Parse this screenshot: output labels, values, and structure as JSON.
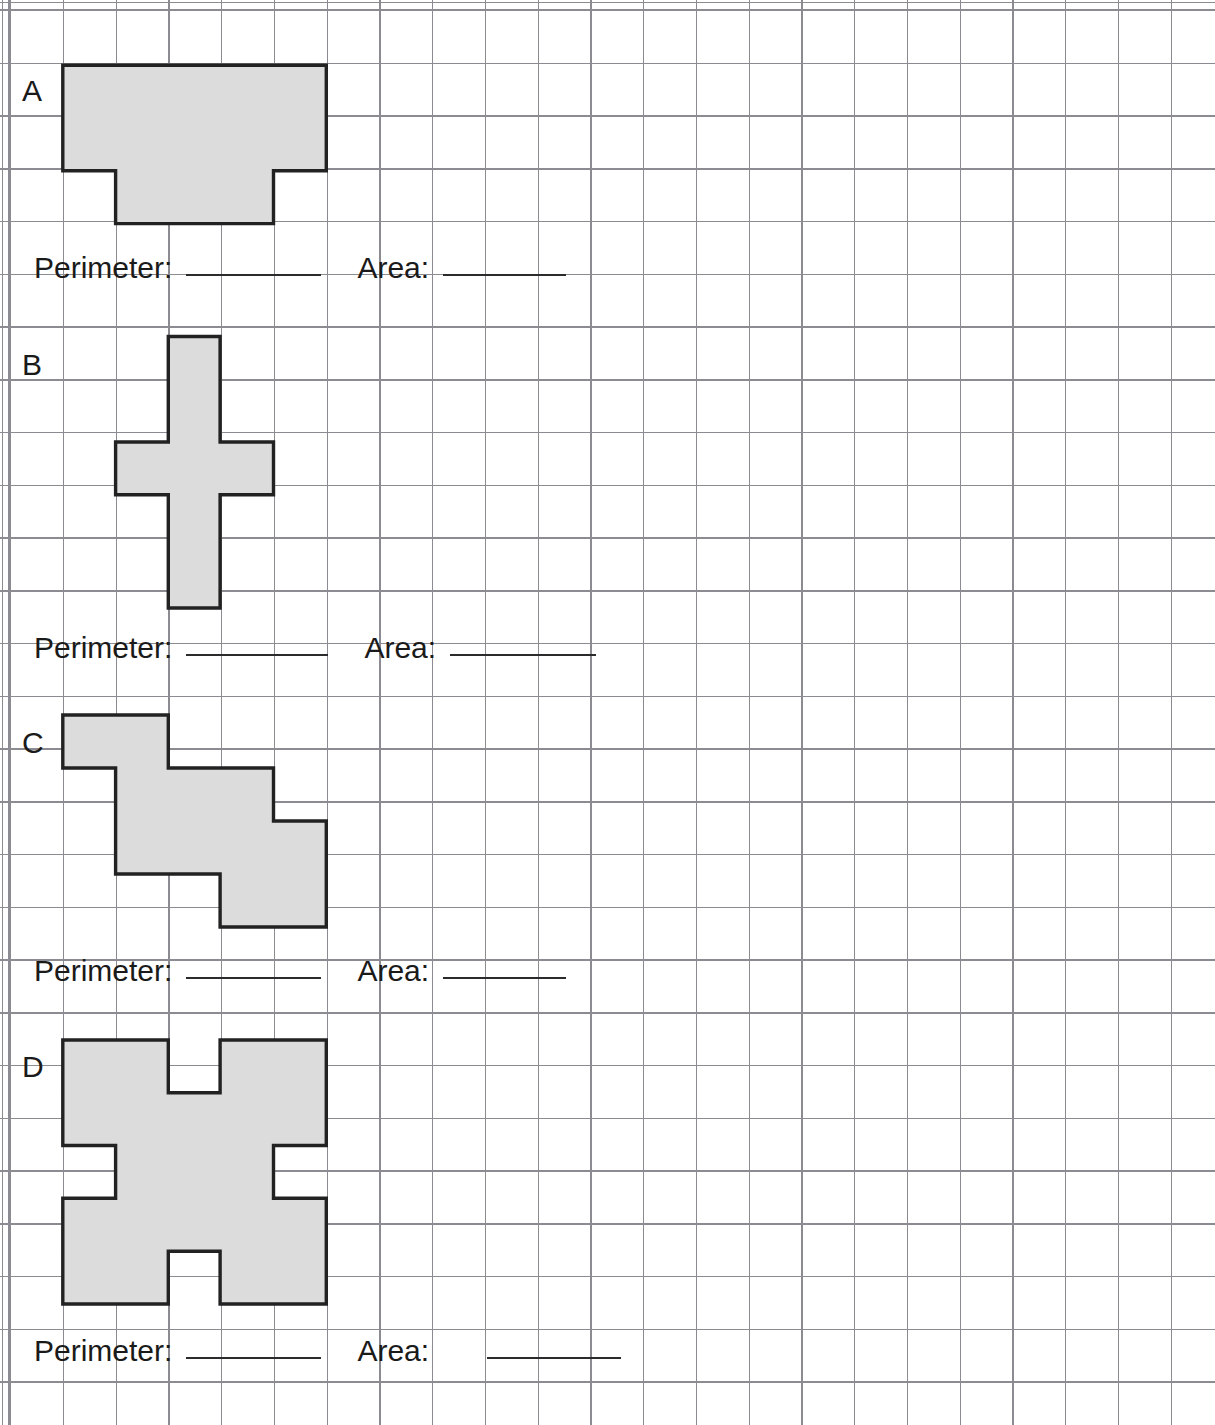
{
  "worksheet": {
    "title": "Perimeter and Area of Rectilinear Shapes Worksheet",
    "grid": {
      "cell_size_px": 52.75,
      "origin_x_px": 10,
      "origin_y_px": 10,
      "columns": 23,
      "rows": 27,
      "line_color": "#8b8b91"
    },
    "shape_style": {
      "fill": "#dcdcdc",
      "stroke": "#222222"
    }
  },
  "labels": {
    "perimeter": "Perimeter:",
    "area": "Area:"
  },
  "questions": [
    {
      "id": "A",
      "letter": "A",
      "shape_name": "t-shape",
      "answer_perimeter": "",
      "answer_area": "",
      "perimeter_label": "Perimeter:",
      "area_label": "Area:"
    },
    {
      "id": "B",
      "letter": "B",
      "shape_name": "cross-shape",
      "answer_perimeter": "",
      "answer_area": "",
      "perimeter_label": "Perimeter:",
      "area_label": "Area:"
    },
    {
      "id": "C",
      "letter": "C",
      "shape_name": "staircase-shape",
      "answer_perimeter": "",
      "answer_area": "",
      "perimeter_label": "Perimeter:",
      "area_label": "Area:"
    },
    {
      "id": "D",
      "letter": "D",
      "shape_name": "notched-square-shape",
      "answer_perimeter": "",
      "answer_area": "",
      "perimeter_label": "Perimeter:",
      "area_label": "Area:"
    }
  ],
  "shape_geometry": {
    "note": "Polygon vertex lists in grid-cell units; origin is the grid top-left corner.",
    "A": {
      "cells": 22,
      "points": "1,1 6,1 6,3 5,3 5,4 2,4 2,3 1,3"
    },
    "B": {
      "cells": 7,
      "points": "2.95,6 4.05,6 4.05,8 5,8 5,9 4.05,9 4.05,11.4 2.95,11.4 2.95,9 2,9 2,8 2.95,8"
    },
    "C": {
      "cells": 8,
      "points": "1,13 3,13 3,14 5,14 5,15 6,15 6,17 4,17 4,16 2,16 2,15 1,15"
    },
    "D": {
      "cells": 21,
      "points": "1,19.5 3,19.5 3,20.5 4,20.5 4,19.5 6,19.5 6,21.5 5,21.5 5,22.5 6,22.5 6,24.5 4,24.5 4,23.5 3,23.5 3,24.5 1,24.5 1,22.5 2,22.5 2,21.5 1,21.5"
    }
  }
}
